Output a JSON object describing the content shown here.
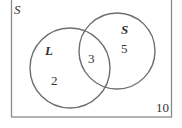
{
  "diagram": {
    "type": "venn",
    "universe": {
      "label": "S",
      "outside_count": "10"
    },
    "sets": [
      {
        "label": "L",
        "only_count": "2"
      },
      {
        "label": "S",
        "only_count": "5"
      }
    ],
    "intersection_count": "3",
    "colors": {
      "stroke": "#6e6e6e",
      "text": "#333333",
      "background": "#ffffff"
    }
  }
}
